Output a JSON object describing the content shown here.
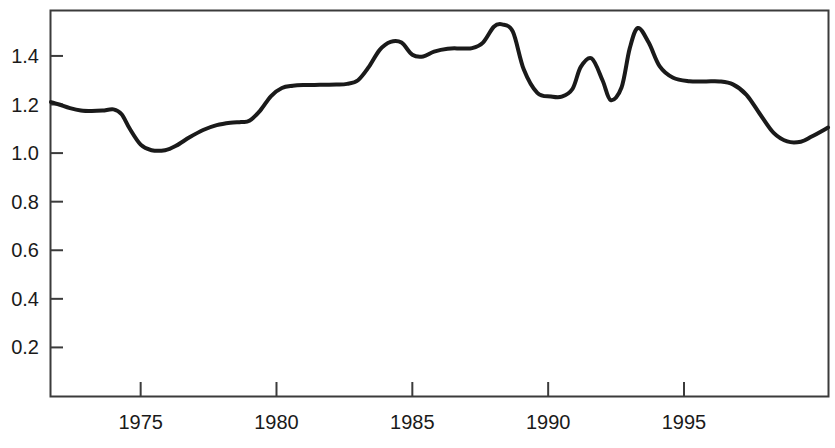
{
  "chart_data": {
    "type": "line",
    "title": "",
    "subtitle": "",
    "xlabel": "",
    "ylabel": "",
    "xlim": [
      1971.7,
      2000.3
    ],
    "ylim": [
      0.0,
      1.585
    ],
    "grid": false,
    "legend": "none",
    "legend_entries": [],
    "annotations": [],
    "x_ticks": [
      1975,
      1980,
      1985,
      1990,
      1995
    ],
    "x_tick_labels": [
      "1975",
      "1980",
      "1985",
      "1990",
      "1995"
    ],
    "y_ticks": [
      0.2,
      0.4,
      0.6,
      0.8,
      1.0,
      1.2,
      1.4
    ],
    "y_tick_labels": [
      "0.2",
      "0.4",
      "0.6",
      "0.8",
      "1.0",
      "1.2",
      "1.4"
    ],
    "series": [
      {
        "name": "series-1",
        "color": "#1a1a1a",
        "x": [
          1971.7,
          1972.0,
          1972.4,
          1972.8,
          1973.2,
          1973.6,
          1974.0,
          1974.3,
          1974.6,
          1975.0,
          1975.4,
          1975.9,
          1976.3,
          1976.8,
          1977.3,
          1977.8,
          1978.3,
          1978.7,
          1979.0,
          1979.4,
          1979.8,
          1980.2,
          1980.6,
          1981.0,
          1981.6,
          1982.2,
          1982.6,
          1983.0,
          1983.4,
          1983.8,
          1984.2,
          1984.6,
          1985.0,
          1985.4,
          1985.8,
          1986.3,
          1986.8,
          1987.2,
          1987.6,
          1988.0,
          1988.3,
          1988.7,
          1989.1,
          1989.6,
          1990.1,
          1990.5,
          1990.9,
          1991.2,
          1991.6,
          1992.0,
          1992.3,
          1992.7,
          1993.0,
          1993.3,
          1993.7,
          1994.1,
          1994.6,
          1995.2,
          1995.8,
          1996.3,
          1996.8,
          1997.3,
          1997.8,
          1998.3,
          1998.8,
          1999.3,
          1999.7,
          2000.3
        ],
        "y": [
          1.21,
          1.2,
          1.185,
          1.175,
          1.173,
          1.175,
          1.18,
          1.16,
          1.1,
          1.035,
          1.012,
          1.012,
          1.03,
          1.065,
          1.095,
          1.115,
          1.125,
          1.128,
          1.133,
          1.175,
          1.235,
          1.268,
          1.277,
          1.28,
          1.281,
          1.282,
          1.285,
          1.3,
          1.355,
          1.425,
          1.458,
          1.455,
          1.405,
          1.398,
          1.418,
          1.43,
          1.431,
          1.432,
          1.455,
          1.52,
          1.53,
          1.5,
          1.345,
          1.248,
          1.233,
          1.232,
          1.265,
          1.355,
          1.39,
          1.3,
          1.218,
          1.27,
          1.43,
          1.515,
          1.455,
          1.358,
          1.31,
          1.296,
          1.295,
          1.295,
          1.283,
          1.24,
          1.16,
          1.083,
          1.048,
          1.047,
          1.068,
          1.105
        ]
      }
    ]
  },
  "axes": {
    "frame_color": "#3b3b3b",
    "series_color": "#1a1a1a",
    "background": "#ffffff"
  }
}
